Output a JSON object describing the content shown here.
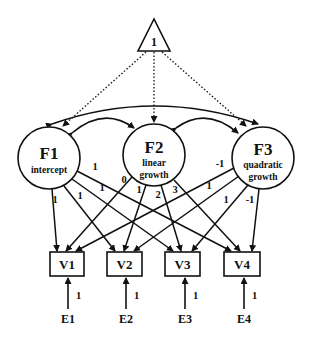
{
  "diagram": {
    "type": "latent growth curve model (path diagram)",
    "constant": {
      "label": "1",
      "shape": "triangle"
    },
    "factors": [
      {
        "id": "F1",
        "name": "F1",
        "sub1": "intercept",
        "sub2": ""
      },
      {
        "id": "F2",
        "name": "F2",
        "sub1": "linear",
        "sub2": "growth"
      },
      {
        "id": "F3",
        "name": "F3",
        "sub1": "quadratic",
        "sub2": "growth"
      }
    ],
    "observed": [
      "V1",
      "V2",
      "V3",
      "V4"
    ],
    "errors": [
      "E1",
      "E2",
      "E3",
      "E4"
    ],
    "error_loadings": [
      "1",
      "1",
      "1",
      "1"
    ],
    "loadings": {
      "F1": [
        "1",
        "1",
        "1",
        "1"
      ],
      "F2": [
        "0",
        "1",
        "2",
        "3"
      ],
      "F3": [
        "-1",
        "1",
        "1",
        "-1"
      ]
    },
    "covariances": [
      [
        "F1",
        "F2"
      ],
      [
        "F2",
        "F3"
      ],
      [
        "F1",
        "F3"
      ]
    ],
    "means_paths": [
      "1->F1",
      "1->F2",
      "1->F3"
    ],
    "colors": {
      "line": "#111111",
      "background": "#ffffff"
    }
  }
}
